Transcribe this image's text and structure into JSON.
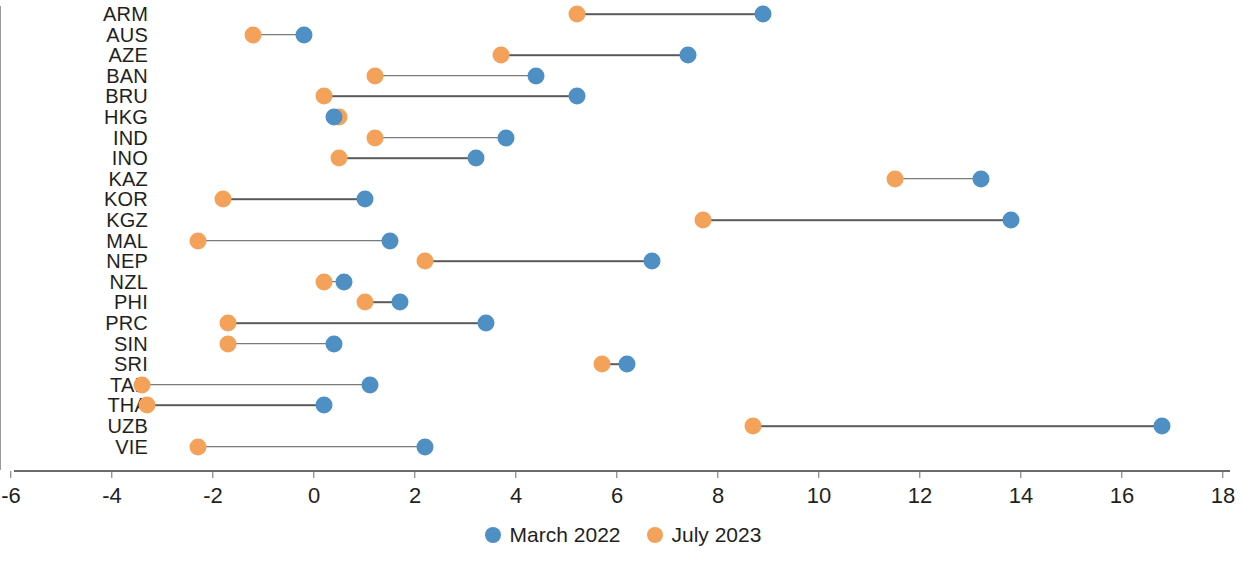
{
  "chart_data": {
    "type": "scatter",
    "subtype": "dumbbell",
    "title": "",
    "xlabel": "",
    "ylabel": "",
    "xlim": [
      -6,
      18
    ],
    "xticks": [
      "-6",
      "-4",
      "-2",
      "0",
      "2",
      "4",
      "6",
      "8",
      "10",
      "12",
      "14",
      "16",
      "18"
    ],
    "xtick_values": [
      -6,
      -4,
      -2,
      0,
      2,
      4,
      6,
      8,
      10,
      12,
      14,
      16,
      18
    ],
    "grid": false,
    "zero_reference_line": 0,
    "legend_position": "bottom-center",
    "legend": [
      {
        "name": "March 2022",
        "color": "#4e8fc4"
      },
      {
        "name": "July 2023",
        "color": "#f4a259"
      }
    ],
    "categories": [
      "ARM",
      "AUS",
      "AZE",
      "BAN",
      "BRU",
      "HKG",
      "IND",
      "INO",
      "KAZ",
      "KOR",
      "KGZ",
      "MAL",
      "NEP",
      "NZL",
      "PHI",
      "PRC",
      "SIN",
      "SRI",
      "TAP",
      "THA",
      "UZB",
      "VIE"
    ],
    "series": [
      {
        "name": "March 2022",
        "color": "#4e8fc4",
        "values": [
          8.9,
          -0.2,
          7.4,
          4.4,
          5.2,
          0.4,
          3.8,
          3.2,
          13.2,
          1.0,
          13.8,
          1.5,
          6.7,
          0.6,
          1.7,
          3.4,
          0.4,
          6.2,
          1.1,
          0.2,
          16.8,
          2.2
        ]
      },
      {
        "name": "July 2023",
        "color": "#f4a259",
        "values": [
          5.2,
          -1.2,
          3.7,
          1.2,
          0.2,
          0.5,
          1.2,
          0.5,
          11.5,
          -1.8,
          7.7,
          -2.3,
          2.2,
          0.2,
          1.0,
          -1.7,
          -1.7,
          5.7,
          -3.4,
          -3.3,
          8.7,
          -2.3
        ]
      }
    ]
  }
}
